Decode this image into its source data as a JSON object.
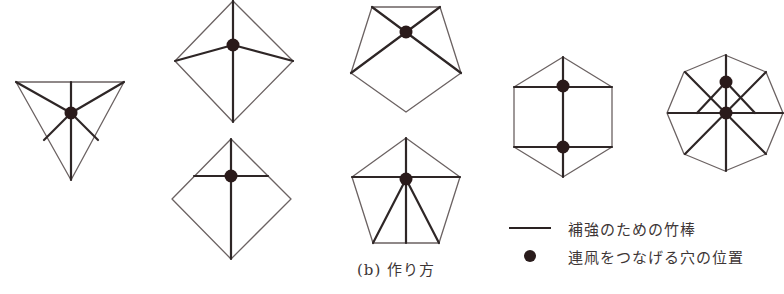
{
  "figure": {
    "caption": "(b) 作り方",
    "colors": {
      "outline": "#6b6262",
      "stick": "#2e2626",
      "hole": "#2a1a1a"
    },
    "shapes": [
      {
        "name": "triangle",
        "sides": 3,
        "holes": 1
      },
      {
        "name": "diamond-upper",
        "sides": 4,
        "holes": 1
      },
      {
        "name": "diamond-lower",
        "sides": 4,
        "holes": 1
      },
      {
        "name": "pentagon-upper",
        "sides": 5,
        "holes": 1
      },
      {
        "name": "pentagon-lower",
        "sides": 5,
        "holes": 1
      },
      {
        "name": "hexagon",
        "sides": 6,
        "holes": 2
      },
      {
        "name": "octagon",
        "sides": 8,
        "holes": 2
      }
    ]
  },
  "legend": {
    "items": [
      {
        "symbol": "line",
        "label": "補強のための竹棒"
      },
      {
        "symbol": "dot",
        "label": "連凧をつなげる穴の位置"
      }
    ]
  }
}
